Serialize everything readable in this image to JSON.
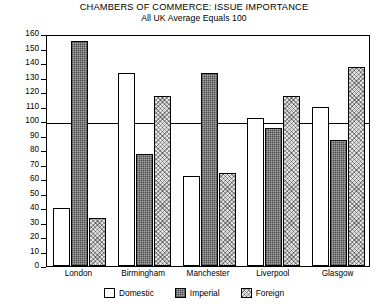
{
  "chart_data": {
    "type": "bar",
    "title": "CHAMBERS OF COMMERCE: ISSUE IMPORTANCE",
    "subtitle": "All UK Average Equals 100",
    "xlabel": "",
    "ylabel": "",
    "ylim": [
      0,
      160
    ],
    "ytick_step": 10,
    "yticks": [
      160,
      150,
      140,
      130,
      120,
      110,
      100,
      90,
      80,
      70,
      60,
      50,
      40,
      30,
      20,
      10,
      0
    ],
    "grid": false,
    "legend_position": "bottom",
    "reference_line": 100,
    "categories": [
      "London",
      "Birmingham",
      "Manchester",
      "Liverpool",
      "Glasgow"
    ],
    "series": [
      {
        "name": "Domestic",
        "fill": "domestic",
        "values": [
          40,
          133,
          62,
          102,
          110
        ]
      },
      {
        "name": "Imperial",
        "fill": "imperial",
        "values": [
          155,
          77,
          133,
          95,
          87
        ]
      },
      {
        "name": "Foreign",
        "fill": "foreign",
        "values": [
          33,
          117,
          64,
          117,
          137
        ]
      }
    ]
  },
  "legend": {
    "items": [
      {
        "label": "Domestic",
        "fill": "domestic"
      },
      {
        "label": "Imperial",
        "fill": "imperial"
      },
      {
        "label": "Foreign",
        "fill": "foreign"
      }
    ]
  },
  "colors": {
    "axis": "#000000",
    "background": "#ffffff",
    "domestic": "#ffffff",
    "imperial": "#a8a8a8",
    "foreign": "#e2e2e2"
  }
}
